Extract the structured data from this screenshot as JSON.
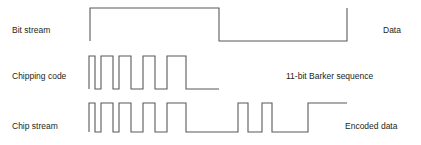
{
  "figure": {
    "width": 421,
    "height": 145,
    "background_color": "#ffffff",
    "stroke_color": "#58595b",
    "text_color": "#231f20"
  },
  "rows": [
    {
      "id": "bit-stream",
      "left_label": "Bit stream",
      "right_label": "Data",
      "left_label_x": 12,
      "left_label_y": 26,
      "right_label_x": 383,
      "right_label_y": 26,
      "baseline_y": 41,
      "top_y": 8,
      "start_x": 90,
      "end_x": 347,
      "bits": [
        1,
        0
      ],
      "transitions": [
        90,
        219,
        347
      ]
    },
    {
      "id": "chipping-code",
      "left_label": "Chipping code",
      "right_label": "11-bit Barker sequence",
      "left_label_x": 12,
      "left_label_y": 72,
      "right_label_x": 286,
      "right_label_y": 72,
      "baseline_y": 89,
      "top_y": 56,
      "start_x": 89,
      "end_x": 219,
      "sequence_name": "11-bit Barker sequence",
      "chips": [
        1,
        0,
        1,
        1,
        0,
        1,
        1,
        1,
        0,
        0,
        0
      ],
      "transitions": [
        89,
        95,
        101,
        113,
        119,
        131,
        143,
        155,
        167,
        186,
        219
      ]
    },
    {
      "id": "chip-stream",
      "left_label": "Chip stream",
      "right_label": "Encoded data",
      "left_label_x": 12,
      "left_label_y": 122,
      "right_label_x": 345,
      "right_label_y": 122,
      "baseline_y": 132,
      "top_y": 103,
      "start_x": 89,
      "end_x": 347,
      "chips": [
        1,
        0,
        1,
        1,
        0,
        1,
        1,
        1,
        0,
        0,
        0,
        0,
        1,
        0,
        0,
        1,
        0,
        0,
        0,
        1,
        1,
        1
      ],
      "transitions_first": [
        89,
        95,
        101,
        113,
        119,
        131,
        143,
        155,
        167,
        186,
        219
      ],
      "transitions_second": [
        219,
        238,
        248,
        262,
        272,
        308,
        347
      ]
    }
  ],
  "waveform_paths": {
    "bit_stream": "M 90 41 L 90 8 L 219 8 L 219 41 L 347 41 L 347 8",
    "chipping_code": "M 89 89 L 89 56 L 95 56 L 95 89 L 101 89 L 101 56 L 113 56 L 113 89 L 119 89 L 119 56 L 131 56 L 131 89 L 143 89 L 143 56 L 155 56 L 155 89 L 167 89 L 167 56 L 186 56 L 186 89 L 219 89",
    "chip_stream": "M 89 132 L 89 103 L 95 103 L 95 132 L 101 132 L 101 103 L 113 103 L 113 132 L 119 132 L 119 103 L 131 103 L 131 132 L 143 132 L 143 103 L 155 103 L 155 132 L 167 132 L 167 103 L 186 103 L 186 132 L 238 132 L 238 103 L 248 103 L 248 132 L 262 132 L 262 103 L 272 103 L 272 132 L 308 132 L 308 103 L 347 103"
  }
}
